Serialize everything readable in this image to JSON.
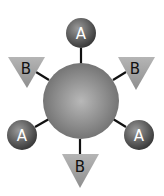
{
  "diagram": {
    "center": {
      "label": "",
      "cx": 81,
      "cy": 101,
      "r": 38
    },
    "colors": {
      "sphere_light": "#b8b8b8",
      "sphere_dark": "#6e6e6e",
      "ball_light": "#9a9a9a",
      "ball_dark": "#3a3a3a",
      "triangle_fill": "#a6a6a6",
      "line": "#111111",
      "ball_text": "#ffffff",
      "triangle_text": "#111111"
    },
    "nodes": [
      {
        "type": "A",
        "label": "A",
        "shape": "circle",
        "position": "top",
        "cx": 81,
        "cy": 33
      },
      {
        "type": "B",
        "label": "B",
        "shape": "triangle",
        "position": "upper-left",
        "cx": 27,
        "cy": 68
      },
      {
        "type": "B",
        "label": "B",
        "shape": "triangle",
        "position": "upper-right",
        "cx": 136,
        "cy": 68
      },
      {
        "type": "A",
        "label": "A",
        "shape": "circle",
        "position": "lower-left",
        "cx": 22,
        "cy": 135
      },
      {
        "type": "A",
        "label": "A",
        "shape": "circle",
        "position": "lower-right",
        "cx": 139,
        "cy": 135
      },
      {
        "type": "B",
        "label": "B",
        "shape": "triangle",
        "position": "bottom",
        "cx": 80,
        "cy": 166
      }
    ]
  }
}
